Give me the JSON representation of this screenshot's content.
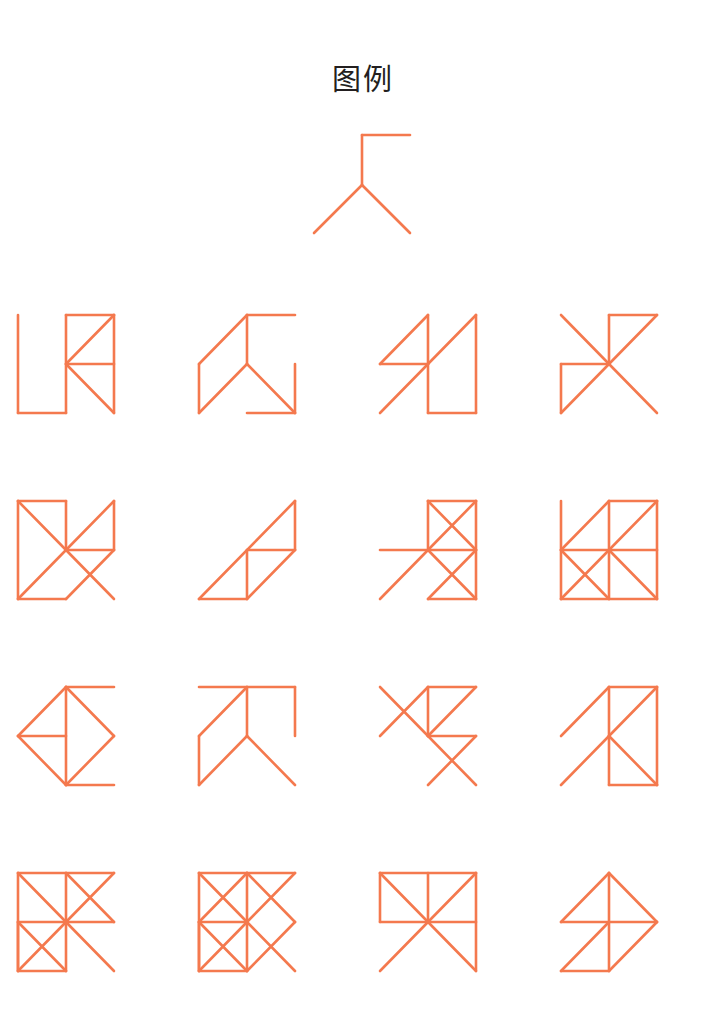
{
  "page": {
    "title": "图例",
    "background_color": "#ffffff",
    "stroke_color": "#f4794e",
    "title_color": "#231f20",
    "width": 725,
    "height": 1030
  },
  "legend": {
    "name": "legend-glyph",
    "description": "单元笔画图例",
    "viewbox": "0 0 145 130",
    "segments": [
      [
        72,
        15,
        120,
        15
      ],
      [
        72,
        15,
        72,
        65
      ],
      [
        72,
        65,
        24,
        113
      ],
      [
        72,
        65,
        120,
        113
      ]
    ]
  },
  "figures": [
    {
      "id": "fig-r1c1",
      "row": 1,
      "col": 1,
      "viewbox": "0 0 181 186",
      "segments": [
        [
          18,
          30,
          18,
          128
        ],
        [
          18,
          128,
          66,
          128
        ],
        [
          66,
          30,
          66,
          128
        ],
        [
          66,
          30,
          114,
          30
        ],
        [
          114,
          30,
          114,
          128
        ],
        [
          66,
          79,
          114,
          79
        ],
        [
          66,
          79,
          114,
          30
        ],
        [
          66,
          79,
          114,
          128
        ]
      ]
    },
    {
      "id": "fig-r1c2",
      "row": 1,
      "col": 2,
      "viewbox": "0 0 181 186",
      "segments": [
        [
          66,
          30,
          114,
          30
        ],
        [
          66,
          30,
          66,
          79
        ],
        [
          66,
          30,
          18,
          79
        ],
        [
          18,
          79,
          18,
          128
        ],
        [
          18,
          128,
          66,
          79
        ],
        [
          66,
          79,
          114,
          128
        ],
        [
          114,
          128,
          114,
          79
        ],
        [
          66,
          128,
          114,
          128
        ]
      ]
    },
    {
      "id": "fig-r1c3",
      "row": 1,
      "col": 3,
      "viewbox": "0 0 181 186",
      "segments": [
        [
          66,
          30,
          66,
          79
        ],
        [
          66,
          30,
          18,
          79
        ],
        [
          18,
          79,
          66,
          79
        ],
        [
          66,
          79,
          114,
          30
        ],
        [
          114,
          30,
          114,
          128
        ],
        [
          66,
          79,
          18,
          128
        ],
        [
          66,
          79,
          66,
          128
        ],
        [
          66,
          128,
          114,
          128
        ]
      ]
    },
    {
      "id": "fig-r1c4",
      "row": 1,
      "col": 4,
      "viewbox": "0 0 181 186",
      "segments": [
        [
          66,
          30,
          114,
          30
        ],
        [
          66,
          30,
          66,
          79
        ],
        [
          66,
          79,
          114,
          30
        ],
        [
          18,
          30,
          66,
          79
        ],
        [
          18,
          79,
          66,
          79
        ],
        [
          18,
          79,
          18,
          128
        ],
        [
          18,
          128,
          66,
          79
        ],
        [
          66,
          79,
          114,
          128
        ]
      ]
    },
    {
      "id": "fig-r2c1",
      "row": 2,
      "col": 1,
      "viewbox": "0 0 181 186",
      "segments": [
        [
          18,
          30,
          66,
          30
        ],
        [
          18,
          30,
          18,
          128
        ],
        [
          66,
          30,
          66,
          79
        ],
        [
          18,
          30,
          66,
          79
        ],
        [
          66,
          79,
          114,
          30
        ],
        [
          114,
          30,
          114,
          79
        ],
        [
          66,
          79,
          114,
          79
        ],
        [
          18,
          128,
          66,
          79
        ],
        [
          66,
          79,
          114,
          128
        ],
        [
          18,
          128,
          66,
          128
        ],
        [
          66,
          128,
          114,
          79
        ]
      ]
    },
    {
      "id": "fig-r2c2",
      "row": 2,
      "col": 2,
      "viewbox": "0 0 181 186",
      "segments": [
        [
          18,
          128,
          114,
          30
        ],
        [
          114,
          30,
          114,
          79
        ],
        [
          66,
          79,
          114,
          79
        ],
        [
          66,
          79,
          66,
          128
        ],
        [
          18,
          128,
          66,
          128
        ],
        [
          66,
          128,
          114,
          79
        ]
      ]
    },
    {
      "id": "fig-r2c3",
      "row": 2,
      "col": 3,
      "viewbox": "0 0 181 186",
      "segments": [
        [
          66,
          30,
          114,
          30
        ],
        [
          66,
          30,
          66,
          79
        ],
        [
          114,
          30,
          114,
          128
        ],
        [
          66,
          30,
          114,
          79
        ],
        [
          114,
          30,
          66,
          79
        ],
        [
          18,
          79,
          114,
          79
        ],
        [
          66,
          79,
          114,
          128
        ],
        [
          114,
          79,
          66,
          128
        ],
        [
          66,
          128,
          114,
          128
        ],
        [
          18,
          128,
          66,
          79
        ]
      ]
    },
    {
      "id": "fig-r2c4",
      "row": 2,
      "col": 4,
      "viewbox": "0 0 181 186",
      "segments": [
        [
          18,
          30,
          18,
          128
        ],
        [
          66,
          30,
          114,
          30
        ],
        [
          66,
          30,
          66,
          128
        ],
        [
          114,
          30,
          114,
          128
        ],
        [
          18,
          79,
          66,
          30
        ],
        [
          66,
          79,
          114,
          30
        ],
        [
          18,
          79,
          114,
          79
        ],
        [
          18,
          128,
          66,
          79
        ],
        [
          18,
          79,
          66,
          128
        ],
        [
          66,
          79,
          114,
          128
        ],
        [
          18,
          128,
          114,
          128
        ]
      ]
    },
    {
      "id": "fig-r3c1",
      "row": 3,
      "col": 1,
      "viewbox": "0 0 181 186",
      "segments": [
        [
          66,
          30,
          114,
          30
        ],
        [
          66,
          30,
          66,
          128
        ],
        [
          66,
          30,
          18,
          79
        ],
        [
          66,
          30,
          114,
          79
        ],
        [
          18,
          79,
          66,
          79
        ],
        [
          18,
          79,
          66,
          128
        ],
        [
          114,
          79,
          66,
          128
        ],
        [
          66,
          128,
          114,
          128
        ]
      ]
    },
    {
      "id": "fig-r3c2",
      "row": 3,
      "col": 2,
      "viewbox": "0 0 181 186",
      "segments": [
        [
          18,
          30,
          114,
          30
        ],
        [
          66,
          30,
          66,
          79
        ],
        [
          66,
          30,
          18,
          79
        ],
        [
          18,
          79,
          18,
          128
        ],
        [
          114,
          30,
          114,
          79
        ],
        [
          66,
          79,
          18,
          128
        ],
        [
          66,
          79,
          114,
          128
        ]
      ]
    },
    {
      "id": "fig-r3c3",
      "row": 3,
      "col": 3,
      "viewbox": "0 0 181 186",
      "segments": [
        [
          66,
          30,
          114,
          30
        ],
        [
          66,
          30,
          66,
          79
        ],
        [
          114,
          30,
          66,
          79
        ],
        [
          18,
          30,
          66,
          79
        ],
        [
          66,
          30,
          18,
          79
        ],
        [
          66,
          79,
          114,
          79
        ],
        [
          66,
          79,
          114,
          128
        ],
        [
          114,
          79,
          66,
          128
        ]
      ]
    },
    {
      "id": "fig-r3c4",
      "row": 3,
      "col": 4,
      "viewbox": "0 0 181 186",
      "segments": [
        [
          66,
          30,
          114,
          30
        ],
        [
          66,
          30,
          66,
          128
        ],
        [
          114,
          30,
          114,
          128
        ],
        [
          114,
          30,
          66,
          79
        ],
        [
          18,
          79,
          66,
          30
        ],
        [
          18,
          128,
          66,
          79
        ],
        [
          66,
          79,
          114,
          128
        ],
        [
          66,
          128,
          114,
          128
        ]
      ]
    },
    {
      "id": "fig-r4c1",
      "row": 4,
      "col": 1,
      "viewbox": "0 0 181 186",
      "segments": [
        [
          18,
          30,
          114,
          30
        ],
        [
          18,
          30,
          18,
          128
        ],
        [
          66,
          30,
          66,
          79
        ],
        [
          18,
          30,
          66,
          79
        ],
        [
          66,
          30,
          114,
          79
        ],
        [
          114,
          30,
          66,
          79
        ],
        [
          18,
          79,
          114,
          79
        ],
        [
          18,
          79,
          18,
          128
        ],
        [
          18,
          79,
          66,
          128
        ],
        [
          18,
          128,
          66,
          79
        ],
        [
          66,
          79,
          66,
          128
        ],
        [
          66,
          79,
          114,
          128
        ],
        [
          18,
          128,
          66,
          128
        ]
      ]
    },
    {
      "id": "fig-r4c2",
      "row": 4,
      "col": 2,
      "viewbox": "0 0 181 186",
      "segments": [
        [
          18,
          30,
          114,
          30
        ],
        [
          18,
          30,
          18,
          128
        ],
        [
          66,
          30,
          66,
          79
        ],
        [
          18,
          30,
          66,
          79
        ],
        [
          66,
          30,
          18,
          79
        ],
        [
          18,
          79,
          66,
          79
        ],
        [
          114,
          30,
          66,
          79
        ],
        [
          66,
          30,
          114,
          79
        ],
        [
          18,
          79,
          18,
          128
        ],
        [
          18,
          128,
          66,
          79
        ],
        [
          66,
          79,
          66,
          128
        ],
        [
          18,
          79,
          66,
          128
        ],
        [
          66,
          79,
          114,
          128
        ],
        [
          114,
          79,
          66,
          128
        ],
        [
          18,
          128,
          66,
          128
        ]
      ]
    },
    {
      "id": "fig-r4c3",
      "row": 4,
      "col": 3,
      "viewbox": "0 0 181 186",
      "segments": [
        [
          18,
          30,
          114,
          30
        ],
        [
          18,
          30,
          18,
          79
        ],
        [
          66,
          30,
          66,
          79
        ],
        [
          114,
          30,
          114,
          128
        ],
        [
          18,
          30,
          66,
          79
        ],
        [
          114,
          30,
          66,
          79
        ],
        [
          18,
          79,
          66,
          79
        ],
        [
          66,
          79,
          114,
          79
        ],
        [
          66,
          79,
          18,
          128
        ],
        [
          66,
          79,
          114,
          128
        ]
      ]
    },
    {
      "id": "fig-r4c4",
      "row": 4,
      "col": 4,
      "viewbox": "0 0 181 186",
      "segments": [
        [
          66,
          30,
          66,
          128
        ],
        [
          66,
          30,
          18,
          79
        ],
        [
          66,
          30,
          114,
          79
        ],
        [
          18,
          79,
          114,
          79
        ],
        [
          18,
          128,
          66,
          79
        ],
        [
          66,
          128,
          114,
          79
        ],
        [
          18,
          128,
          66,
          128
        ]
      ]
    }
  ]
}
